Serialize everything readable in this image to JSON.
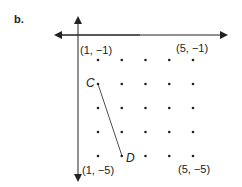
{
  "part_label": "b.",
  "axes": {
    "x_axis": "horizontal",
    "y_axis": "vertical"
  },
  "corner_labels": {
    "top_left": "(1, −1)",
    "top_right": "(5, −1)",
    "bottom_left": "(1, −5)",
    "bottom_right": "(5, −5)"
  },
  "points": {
    "C": {
      "label": "C",
      "coord": [
        1,
        -2
      ]
    },
    "D": {
      "label": "D",
      "coord": [
        2,
        -5
      ]
    }
  },
  "grid": {
    "x_values": [
      1,
      2,
      3,
      4,
      5
    ],
    "y_values": [
      -1,
      -2,
      -3,
      -4,
      -5
    ]
  },
  "segment": [
    "C",
    "D"
  ]
}
